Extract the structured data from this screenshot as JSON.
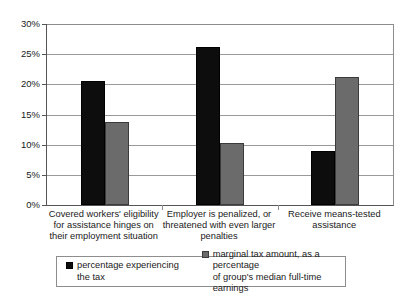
{
  "top_bleed_text": "                                                                                                                    ",
  "chart_data": {
    "type": "bar",
    "title": "",
    "subtitle": "",
    "xlabel": "",
    "ylabel": "",
    "ylim": [
      0,
      30
    ],
    "ytick_values": [
      0,
      5,
      10,
      15,
      20,
      25,
      30
    ],
    "ytick_labels": [
      "0%",
      "5%",
      "10%",
      "15%",
      "20%",
      "25%",
      "30%"
    ],
    "grid": true,
    "legend_position": "bottom",
    "categories": [
      "Covered workers' eligibility\nfor assistance hinges on\ntheir employment situation",
      "Employer is penalized, or\nthreatened with even larger\npenalties",
      "Receive means-tested\nassistance"
    ],
    "series": [
      {
        "name": "percentage experiencing\nthe tax",
        "color": "#0d0d0d",
        "values": [
          20.5,
          26.2,
          8.9
        ]
      },
      {
        "name": "marginal tax amount, as a percentage\nof  group's median full-time earnings",
        "color": "#6b6b6b",
        "values": [
          13.7,
          10.2,
          21.2
        ]
      }
    ]
  }
}
